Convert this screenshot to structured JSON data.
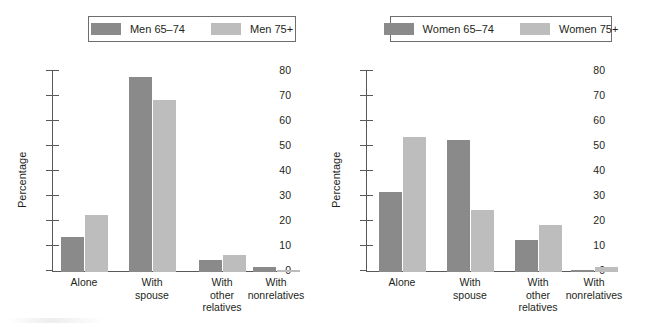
{
  "chart_data": [
    {
      "type": "bar",
      "panel": "left",
      "title": "",
      "xlabel": "",
      "ylabel": "Percentage",
      "ylim": [
        0,
        80
      ],
      "ytick_step": 10,
      "yticks": [
        "0",
        "10",
        "20",
        "30",
        "40",
        "50",
        "60",
        "70",
        "80"
      ],
      "grid": false,
      "legend_position": "top-center",
      "categories": [
        "Alone",
        "With\nspouse",
        "With\nother\nrelatives",
        "With\nnonrelatives"
      ],
      "series": [
        {
          "name": "Men 65–74",
          "color": "#8a8a8a",
          "values": [
            14,
            78,
            5,
            2
          ]
        },
        {
          "name": "Men 75+",
          "color": "#bdbdbd",
          "values": [
            23,
            69,
            7,
            1
          ]
        }
      ]
    },
    {
      "type": "bar",
      "panel": "right",
      "title": "",
      "xlabel": "",
      "ylabel": "Percentage",
      "ylim": [
        0,
        80
      ],
      "ytick_step": 10,
      "yticks": [
        "0",
        "10",
        "20",
        "30",
        "40",
        "50",
        "60",
        "70",
        "80"
      ],
      "grid": false,
      "legend_position": "top-center",
      "categories": [
        "Alone",
        "With\nspouse",
        "With\nother\nrelatives",
        "With\nnonrelatives"
      ],
      "series": [
        {
          "name": "Women 65–74",
          "color": "#8a8a8a",
          "values": [
            32,
            53,
            13,
            1
          ]
        },
        {
          "name": "Women 75+",
          "color": "#bdbdbd",
          "values": [
            54,
            25,
            19,
            2
          ]
        }
      ]
    }
  ],
  "colors": {
    "series_dark": "#8a8a8a",
    "series_light": "#bdbdbd",
    "axis": "#58595b",
    "text": "#231f20",
    "legend_border": "#6d6e71",
    "background": "#ffffff"
  }
}
